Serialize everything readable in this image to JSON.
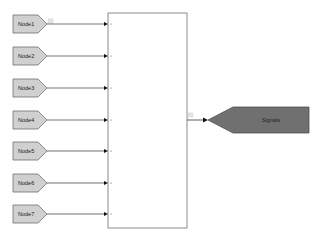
{
  "diagram": {
    "inputs": [
      {
        "label": "Node1",
        "y": 24
      },
      {
        "label": "Node2",
        "y": 56
      },
      {
        "label": "Node3",
        "y": 88
      },
      {
        "label": "Node4",
        "y": 120
      },
      {
        "label": "Node5",
        "y": 151
      },
      {
        "label": "Node6",
        "y": 183
      },
      {
        "label": "Node7",
        "y": 214
      }
    ],
    "mux_block": {
      "x": 108,
      "y": 13,
      "width": 79,
      "height": 215
    },
    "output": {
      "label": "Signals",
      "y": 120
    },
    "colors": {
      "input_fill": "#d0d0d0",
      "input_stroke": "#707070",
      "output_fill": "#707070",
      "output_stroke": "#505050",
      "block_stroke": "#8c8c8c",
      "line": "#333333"
    }
  }
}
